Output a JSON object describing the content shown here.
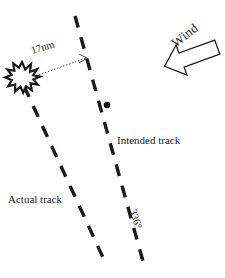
{
  "figure": {
    "type": "aviation-track-diagram",
    "background_color": "#ffffff",
    "ink_color": "#1a1a1a"
  },
  "labels": {
    "intended_track": "Intended track",
    "actual_track": "Actual track",
    "distance": "17nm",
    "bearing": "336°",
    "wind": "Wind",
    "ghost_artifact": " "
  },
  "elements": {
    "intended_track_line": {
      "name": "intended-track",
      "style": "dashed",
      "start": [
        75,
        16
      ],
      "end": [
        144,
        265
      ]
    },
    "actual_track_line": {
      "name": "actual-track",
      "style": "dashed",
      "start": [
        24,
        86
      ],
      "end": [
        106,
        264
      ]
    },
    "crash_site": {
      "name": "starburst",
      "center": [
        22,
        76
      ],
      "radius": 13
    },
    "waypoint_dot": {
      "name": "position-dot",
      "center": [
        107,
        105
      ],
      "radius": 3.2
    },
    "distance_arrow": {
      "name": "dotted-measure-arrow",
      "from": [
        32,
        78
      ],
      "to": [
        88,
        58
      ],
      "style": "dotted-with-arrowhead"
    },
    "wind_arrow": {
      "name": "wind-arrow",
      "direction": "left-down",
      "fill": "#ffffff",
      "stroke": "#1a1a1a"
    }
  }
}
